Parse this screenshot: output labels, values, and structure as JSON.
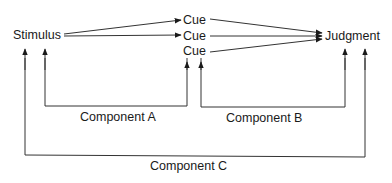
{
  "diagram": {
    "nodes": {
      "stimulus": "Stimulus",
      "cues": [
        "Cue",
        "Cue",
        "Cue"
      ],
      "judgment": "Judgment"
    },
    "components": {
      "a": "Component A",
      "b": "Component B",
      "c": "Component C"
    },
    "colors": {
      "line": "#333333",
      "text": "#1a1a1a",
      "background": "#ffffff"
    }
  }
}
